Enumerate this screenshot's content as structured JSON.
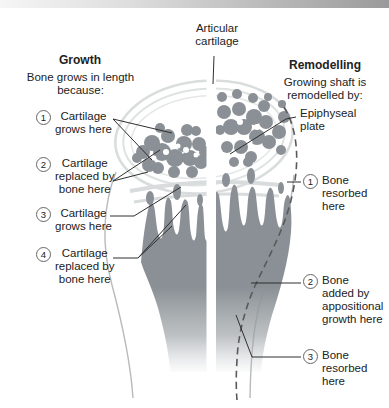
{
  "labels": {
    "articular_cartilage": "Articular\ncartilage"
  },
  "growth": {
    "title": "Growth",
    "subtitle": "Bone grows in length\nbecause:",
    "items": [
      {
        "num": "1",
        "label": "Cartilage\ngrows here"
      },
      {
        "num": "2",
        "label": "Cartilage\nreplaced by\nbone here"
      },
      {
        "num": "3",
        "label": "Cartilage\ngrows here"
      },
      {
        "num": "4",
        "label": "Cartilage\nreplaced by\nbone here"
      }
    ]
  },
  "remodelling": {
    "title": "Remodelling",
    "subtitle": "Growing shaft is\nremodelled by:",
    "epiphyseal_plate": "Epiphyseal\nplate",
    "items": [
      {
        "num": "1",
        "label": "Bone\nresorbed\nhere"
      },
      {
        "num": "2",
        "label": "Bone\nadded by\nappositional\ngrowth here"
      },
      {
        "num": "3",
        "label": "Bone\nresorbed\nhere"
      }
    ]
  },
  "colors": {
    "bone_gray": "#8a9095",
    "cartilage_band": "#d9dddd",
    "outline_gray": "#b7bbbd",
    "dashed_line": "#595959",
    "leader_line": "#2f2f2f",
    "text": "#222222",
    "topbar_left": "#f6f6f6",
    "topbar_right": "#9a9a9a"
  }
}
